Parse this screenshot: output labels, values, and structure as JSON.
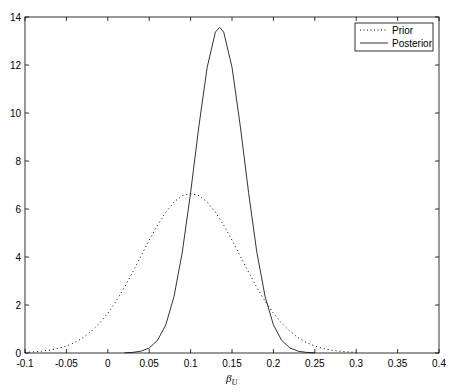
{
  "chart_data": {
    "type": "line",
    "title": "",
    "xlabel": "β_U",
    "xlabel_main": "β",
    "xlabel_sub": "U",
    "ylabel": "",
    "xlim": [
      -0.1,
      0.4
    ],
    "ylim": [
      0,
      14
    ],
    "grid": false,
    "legend_position": "upper right",
    "xticks": [
      -0.1,
      -0.05,
      0,
      0.05,
      0.1,
      0.15,
      0.2,
      0.25,
      0.3,
      0.35,
      0.4
    ],
    "xtick_labels": [
      "-0.1",
      "-0.05",
      "0",
      "0.05",
      "0.1",
      "0.15",
      "0.2",
      "0.25",
      "0.3",
      "0.35",
      "0.4"
    ],
    "yticks": [
      0,
      2,
      4,
      6,
      8,
      10,
      12,
      14
    ],
    "ytick_labels": [
      "0",
      "2",
      "4",
      "6",
      "8",
      "10",
      "12",
      "14"
    ],
    "series": [
      {
        "name": "Prior",
        "style": "dotted",
        "color": "#000000",
        "x": [
          -0.1,
          -0.09,
          -0.08,
          -0.07,
          -0.06,
          -0.05,
          -0.04,
          -0.03,
          -0.02,
          -0.01,
          0,
          0.01,
          0.02,
          0.03,
          0.04,
          0.05,
          0.06,
          0.07,
          0.08,
          0.09,
          0.1,
          0.11,
          0.12,
          0.13,
          0.14,
          0.15,
          0.16,
          0.17,
          0.18,
          0.19,
          0.2,
          0.21,
          0.22,
          0.23,
          0.24,
          0.25,
          0.26,
          0.27,
          0.28,
          0.29,
          0.3
        ],
        "y": [
          0.026,
          0.044,
          0.074,
          0.12,
          0.19,
          0.292,
          0.437,
          0.636,
          0.9,
          1.238,
          1.658,
          2.159,
          2.733,
          3.366,
          4.033,
          4.698,
          5.324,
          5.868,
          6.29,
          6.557,
          6.649,
          6.557,
          6.29,
          5.868,
          5.324,
          4.698,
          4.033,
          3.366,
          2.733,
          2.159,
          1.658,
          1.238,
          0.9,
          0.636,
          0.437,
          0.292,
          0.19,
          0.12,
          0.074,
          0.044,
          0.026
        ]
      },
      {
        "name": "Posterior",
        "style": "solid",
        "color": "#000000",
        "x": [
          0.02,
          0.03,
          0.04,
          0.05,
          0.06,
          0.07,
          0.08,
          0.09,
          0.1,
          0.11,
          0.12,
          0.13,
          0.135,
          0.14,
          0.15,
          0.16,
          0.17,
          0.18,
          0.19,
          0.2,
          0.21,
          0.22,
          0.23,
          0.24,
          0.25
        ],
        "y": [
          0.006,
          0.023,
          0.073,
          0.207,
          0.523,
          1.177,
          2.356,
          4.204,
          6.679,
          9.449,
          11.91,
          13.37,
          13.57,
          13.37,
          11.91,
          9.449,
          6.679,
          4.204,
          2.356,
          1.177,
          0.523,
          0.207,
          0.073,
          0.023,
          0.006
        ]
      }
    ]
  },
  "legend": {
    "items": [
      {
        "label": "Prior"
      },
      {
        "label": "Posterior"
      }
    ]
  }
}
